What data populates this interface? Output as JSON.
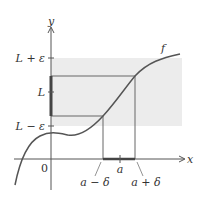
{
  "diagram": {
    "axes": {
      "x_label": "x",
      "y_label": "y",
      "origin_label": "0"
    },
    "y_ticks": [
      {
        "label": "L + ε",
        "role": "upper-epsilon"
      },
      {
        "label": "L",
        "role": "limit"
      },
      {
        "label": "L − ε",
        "role": "lower-epsilon"
      }
    ],
    "x_ticks": [
      {
        "label": "a − δ",
        "role": "left-delta"
      },
      {
        "label": "a",
        "role": "point"
      },
      {
        "label": "a + δ",
        "role": "right-delta"
      }
    ],
    "curve_label": "f",
    "colors": {
      "band": "#ececec",
      "curve": "#555555",
      "axes": "#555555",
      "highlight": "#444444"
    }
  }
}
